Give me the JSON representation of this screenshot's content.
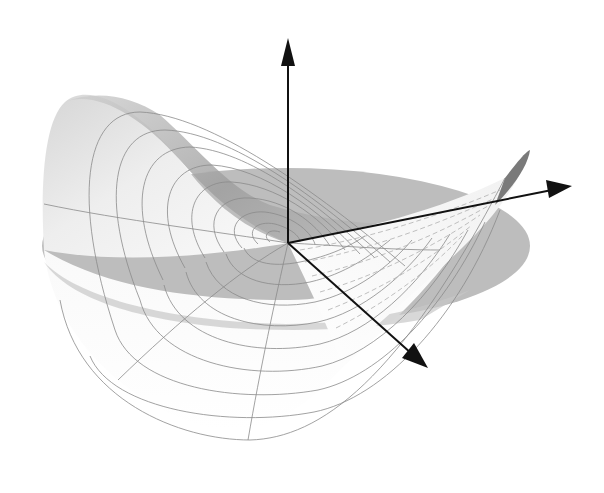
{
  "figure": {
    "colors": {
      "background": "#ffffff",
      "disk": "#bdbdbd",
      "surface_light": "#f4f4f4",
      "surface_dark": "#9a9a9a",
      "grid_lines": "#8a8a8a",
      "axes": "#111111"
    },
    "axes": [
      {
        "name": "z-axis",
        "from": [
          288,
          243
        ],
        "to": [
          288,
          40
        ]
      },
      {
        "name": "x-axis",
        "from": [
          288,
          243
        ],
        "to": [
          572,
          186
        ]
      },
      {
        "name": "y-axis",
        "from": [
          288,
          243
        ],
        "to": [
          426,
          367
        ]
      }
    ],
    "disk": {
      "cx": 286,
      "cy": 246,
      "rx": 244,
      "ry": 78
    },
    "origin": [
      288,
      243
    ],
    "polar_grid": {
      "circles": 9,
      "radial_lines": 6
    }
  }
}
